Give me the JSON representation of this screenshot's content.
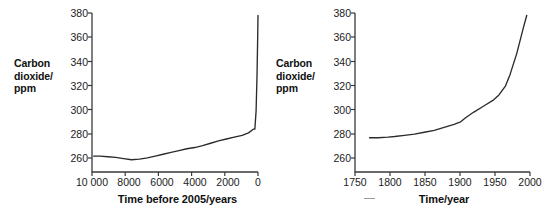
{
  "figure": {
    "background_color": "#ffffff",
    "line_color": "#2b2b2b",
    "axis_color": "#3a3a3a",
    "text_color": "#1a1a1a"
  },
  "panels": [
    {
      "id": "left",
      "ylabel_lines": [
        "Carbon",
        "dioxide/",
        "ppm"
      ],
      "xlabel": "Time before 2005/years",
      "yticks": [
        "260",
        "280",
        "300",
        "320",
        "340",
        "360",
        "380"
      ],
      "xticks": [
        "10 000",
        "8000",
        "6000",
        "4000",
        "2000",
        "0"
      ]
    },
    {
      "id": "right",
      "ylabel_lines": [
        "Carbon",
        "dioxide/",
        "ppm"
      ],
      "xlabel": "Time/year",
      "yticks": [
        "260",
        "280",
        "300",
        "320",
        "340",
        "360",
        "380"
      ],
      "xticks": [
        "1750",
        "1800",
        "1850",
        "1900",
        "1950",
        "2000"
      ]
    }
  ],
  "chart_data": [
    {
      "type": "line",
      "title": "",
      "xlabel": "Time before 2005/years",
      "ylabel": "Carbon dioxide/ppm",
      "xlim": [
        10500,
        0
      ],
      "ylim": [
        250,
        380
      ],
      "x_inverted": true,
      "xticks": [
        10000,
        8000,
        6000,
        4000,
        2000,
        0
      ],
      "xtick_labels": [
        "10 000",
        "8000",
        "6000",
        "4000",
        "2000",
        "0"
      ],
      "yticks": [
        260,
        280,
        300,
        320,
        340,
        360,
        380
      ],
      "grid": false,
      "legend": false,
      "series": [
        {
          "name": "Carbon dioxide",
          "x": [
            10400,
            10000,
            9500,
            9000,
            8500,
            8000,
            7500,
            7000,
            6500,
            6000,
            5500,
            5000,
            4500,
            4000,
            3500,
            3000,
            2500,
            2000,
            1500,
            1000,
            600,
            300,
            200,
            120,
            60,
            20,
            0
          ],
          "y": [
            263,
            263,
            262.5,
            262,
            261,
            260,
            260.5,
            261.5,
            263,
            264.5,
            266,
            267.5,
            269,
            270,
            271.5,
            273.5,
            275.5,
            277,
            278.5,
            280,
            282,
            285,
            285,
            300,
            330,
            360,
            378
          ]
        }
      ]
    },
    {
      "type": "line",
      "title": "",
      "xlabel": "Time/year",
      "ylabel": "Carbon dioxide/ppm",
      "xlim": [
        1740,
        2005
      ],
      "ylim": [
        250,
        380
      ],
      "x_inverted": false,
      "xticks": [
        1750,
        1800,
        1850,
        1900,
        1950,
        2000
      ],
      "xtick_labels": [
        "1750",
        "1800",
        "1850",
        "1900",
        "1950",
        "2000"
      ],
      "yticks": [
        260,
        280,
        300,
        320,
        340,
        360,
        380
      ],
      "grid": false,
      "legend": false,
      "series": [
        {
          "name": "Carbon dioxide",
          "x": [
            1762,
            1775,
            1790,
            1800,
            1815,
            1830,
            1845,
            1860,
            1875,
            1890,
            1900,
            1908,
            1920,
            1935,
            1950,
            1958,
            1968,
            1975,
            1985,
            1995,
            2000
          ],
          "y": [
            278,
            278,
            278.5,
            279,
            280,
            281,
            282.5,
            284,
            286.5,
            289,
            291,
            294.5,
            299,
            304,
            309,
            313,
            320.5,
            330,
            347,
            368,
            378
          ]
        }
      ]
    }
  ]
}
